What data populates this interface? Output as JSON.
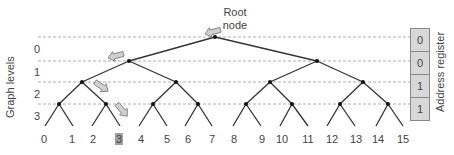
{
  "diagram": {
    "root_label_line1": "Root",
    "root_label_line2": "node",
    "y_axis_label": "Graph levels",
    "register_label": "Address register",
    "levels": [
      "0",
      "1",
      "2",
      "3"
    ],
    "register_bits": [
      "0",
      "0",
      "1",
      "1"
    ],
    "leaves": [
      "0",
      "1",
      "2",
      "3",
      "4",
      "5",
      "6",
      "7",
      "8",
      "9",
      "10",
      "11",
      "12",
      "13",
      "14",
      "15"
    ],
    "highlighted_leaf": "3",
    "colors": {
      "edge": "#333333",
      "dashed_line": "#999999",
      "arrow_fill": "#d0d0d0",
      "arrow_stroke": "#777777",
      "register_fill": "#d8d8d8",
      "highlight": "#a0a0a0"
    }
  }
}
